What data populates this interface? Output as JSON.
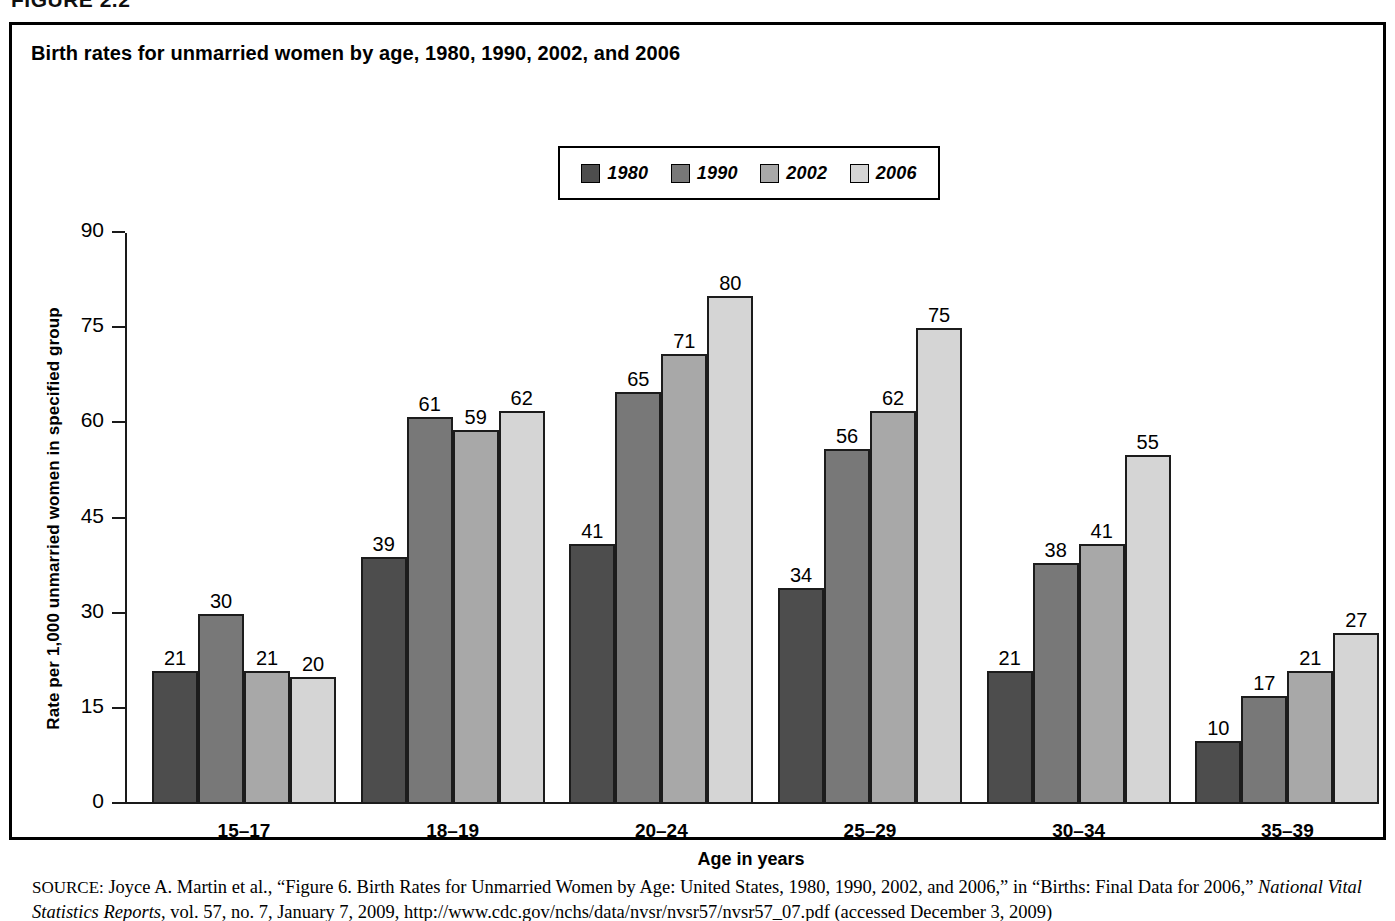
{
  "figure_caption": "FIGURE 2.2",
  "chart_title": "Birth rates for unmarried women by age, 1980, 1990, 2002, and 2006",
  "axis": {
    "x_title": "Age in years",
    "y_title": "Rate per 1,000 unmarried women in specified group"
  },
  "legend": {
    "items": [
      {
        "label": "1980",
        "color": "#4d4d4d"
      },
      {
        "label": "1990",
        "color": "#787878"
      },
      {
        "label": "2002",
        "color": "#a8a8a8"
      },
      {
        "label": "2006",
        "color": "#d5d5d5"
      }
    ]
  },
  "source": {
    "label": "SOURCE:",
    "text": "Joyce A. Martin et al., “Figure 6. Birth Rates for Unmarried Women by Age: United States, 1980, 1990, 2002, and 2006,” in “Births: Final Data for 2006,” ",
    "italic_title": "National Vital Statistics Reports",
    "text_after": ", vol. 57, no. 7, January 7, 2009, http://www.cdc.gov/nchs/data/nvsr/nvsr57/nvsr57_07.pdf (accessed",
    "text_cut": "December 3, 2009)"
  },
  "chart_data": {
    "type": "bar",
    "title": "Birth rates for unmarried women by age, 1980, 1990, 2002, and 2006",
    "xlabel": "Age in years",
    "ylabel": "Rate per 1,000 unmarried women in specified group",
    "ylim": [
      0,
      90
    ],
    "yticks": [
      0,
      15,
      30,
      45,
      60,
      75,
      90
    ],
    "grid": false,
    "legend_position": "top-center",
    "categories": [
      "15–17",
      "18–19",
      "20–24",
      "25–29",
      "30–34",
      "35–39"
    ],
    "series": [
      {
        "name": "1980",
        "color": "#4d4d4d",
        "values": [
          21,
          39,
          41,
          34,
          21,
          10
        ]
      },
      {
        "name": "1990",
        "color": "#787878",
        "values": [
          30,
          61,
          65,
          56,
          38,
          17
        ]
      },
      {
        "name": "2002",
        "color": "#a8a8a8",
        "values": [
          21,
          59,
          71,
          62,
          41,
          21
        ]
      },
      {
        "name": "2006",
        "color": "#d5d5d5",
        "values": [
          20,
          62,
          80,
          75,
          55,
          27
        ]
      }
    ]
  }
}
